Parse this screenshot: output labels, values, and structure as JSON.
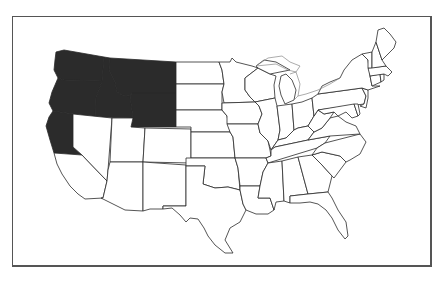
{
  "map": {
    "subject": "United States (contiguous) state outline map",
    "highlight_color": "#2b2b2b",
    "base_color": "#ffffff",
    "border_color": "#2a2a2a",
    "frame_color": "#555555",
    "highlighted_states": [
      "Washington",
      "Oregon",
      "Idaho",
      "Montana",
      "Wyoming",
      "Northern California"
    ],
    "states": [
      {
        "name": "Washington",
        "id": "WA",
        "highlighted": true
      },
      {
        "name": "Oregon",
        "id": "OR",
        "highlighted": true
      },
      {
        "name": "Idaho",
        "id": "ID",
        "highlighted": true
      },
      {
        "name": "Montana",
        "id": "MT",
        "highlighted": true
      },
      {
        "name": "Wyoming",
        "id": "WY",
        "highlighted": true
      },
      {
        "name": "Northern California",
        "id": "NCA",
        "highlighted": true
      },
      {
        "name": "California",
        "id": "CA",
        "highlighted": false
      },
      {
        "name": "Nevada",
        "id": "NV",
        "highlighted": false
      },
      {
        "name": "Utah",
        "id": "UT",
        "highlighted": false
      },
      {
        "name": "Arizona",
        "id": "AZ",
        "highlighted": false
      },
      {
        "name": "Colorado",
        "id": "CO",
        "highlighted": false
      },
      {
        "name": "New Mexico",
        "id": "NM",
        "highlighted": false
      },
      {
        "name": "North Dakota",
        "id": "ND",
        "highlighted": false
      },
      {
        "name": "South Dakota",
        "id": "SD",
        "highlighted": false
      },
      {
        "name": "Nebraska",
        "id": "NE",
        "highlighted": false
      },
      {
        "name": "Kansas",
        "id": "KS",
        "highlighted": false
      },
      {
        "name": "Oklahoma",
        "id": "OK",
        "highlighted": false
      },
      {
        "name": "Texas",
        "id": "TX",
        "highlighted": false
      },
      {
        "name": "Minnesota",
        "id": "MN",
        "highlighted": false
      },
      {
        "name": "Iowa",
        "id": "IA",
        "highlighted": false
      },
      {
        "name": "Missouri",
        "id": "MO",
        "highlighted": false
      },
      {
        "name": "Arkansas",
        "id": "AR",
        "highlighted": false
      },
      {
        "name": "Louisiana",
        "id": "LA",
        "highlighted": false
      },
      {
        "name": "Wisconsin",
        "id": "WI",
        "highlighted": false
      },
      {
        "name": "Illinois",
        "id": "IL",
        "highlighted": false
      },
      {
        "name": "Michigan",
        "id": "MI",
        "highlighted": false
      },
      {
        "name": "Indiana",
        "id": "IN",
        "highlighted": false
      },
      {
        "name": "Ohio",
        "id": "OH",
        "highlighted": false
      },
      {
        "name": "Kentucky",
        "id": "KY",
        "highlighted": false
      },
      {
        "name": "Tennessee",
        "id": "TN",
        "highlighted": false
      },
      {
        "name": "Mississippi",
        "id": "MS",
        "highlighted": false
      },
      {
        "name": "Alabama",
        "id": "AL",
        "highlighted": false
      },
      {
        "name": "Georgia",
        "id": "GA",
        "highlighted": false
      },
      {
        "name": "Florida",
        "id": "FL",
        "highlighted": false
      },
      {
        "name": "South Carolina",
        "id": "SC",
        "highlighted": false
      },
      {
        "name": "North Carolina",
        "id": "NC",
        "highlighted": false
      },
      {
        "name": "Virginia",
        "id": "VA",
        "highlighted": false
      },
      {
        "name": "West Virginia",
        "id": "WV",
        "highlighted": false
      },
      {
        "name": "Pennsylvania",
        "id": "PA",
        "highlighted": false
      },
      {
        "name": "New York",
        "id": "NY",
        "highlighted": false
      },
      {
        "name": "Maryland",
        "id": "MD",
        "highlighted": false
      },
      {
        "name": "Delaware",
        "id": "DE",
        "highlighted": false
      },
      {
        "name": "New Jersey",
        "id": "NJ",
        "highlighted": false
      },
      {
        "name": "Connecticut",
        "id": "CT",
        "highlighted": false
      },
      {
        "name": "Rhode Island",
        "id": "RI",
        "highlighted": false
      },
      {
        "name": "Massachusetts",
        "id": "MA",
        "highlighted": false
      },
      {
        "name": "Vermont",
        "id": "VT",
        "highlighted": false
      },
      {
        "name": "New Hampshire",
        "id": "NH",
        "highlighted": false
      },
      {
        "name": "Maine",
        "id": "ME",
        "highlighted": false
      }
    ]
  }
}
